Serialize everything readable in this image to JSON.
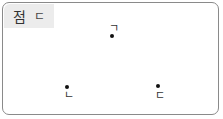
{
  "header": {
    "title_word": "점",
    "title_letter": "ㄷ"
  },
  "points": [
    {
      "label": "ㄱ"
    },
    {
      "label": "ㄴ"
    },
    {
      "label": "ㄷ"
    }
  ]
}
